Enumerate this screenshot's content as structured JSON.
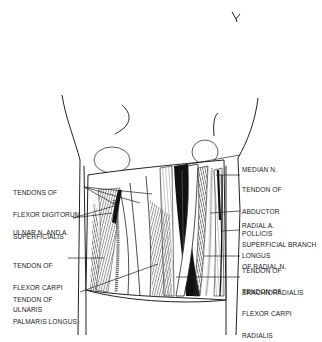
{
  "figure": {
    "colors": {
      "ink": "#1a1a1a",
      "background": "#ffffff",
      "shade": "#6a6a6a"
    }
  },
  "labels": {
    "left": [
      {
        "id": "fds",
        "lines": [
          "TENDONS OF",
          "FLEXOR DIGITORUM",
          "SUPERFICIALIS"
        ]
      },
      {
        "id": "ulnar",
        "lines": [
          "ULNAR N. AND A."
        ]
      },
      {
        "id": "fcu",
        "lines": [
          "TENDON OF",
          "FLEXOR CARPI",
          "ULNARIS"
        ]
      },
      {
        "id": "pl",
        "lines": [
          "TENDON OF",
          "PALMARIS LONGUS"
        ]
      }
    ],
    "right": [
      {
        "id": "median",
        "lines": [
          "MEDIAN N."
        ]
      },
      {
        "id": "apl",
        "lines": [
          "TENDON OF",
          "ABDUCTOR",
          "POLLICIS",
          "LONGUS"
        ]
      },
      {
        "id": "radial_a",
        "lines": [
          "RADIAL A."
        ]
      },
      {
        "id": "sbrn",
        "lines": [
          "SUPERFICIAL BRANCH",
          "OF RADIAL N."
        ]
      },
      {
        "id": "br",
        "lines": [
          "TENDON OF",
          "BRACHIORADIALIS"
        ]
      },
      {
        "id": "fcr",
        "lines": [
          "TENDON OF",
          "FLEXOR CARPI",
          "RADIALIS"
        ]
      }
    ]
  }
}
